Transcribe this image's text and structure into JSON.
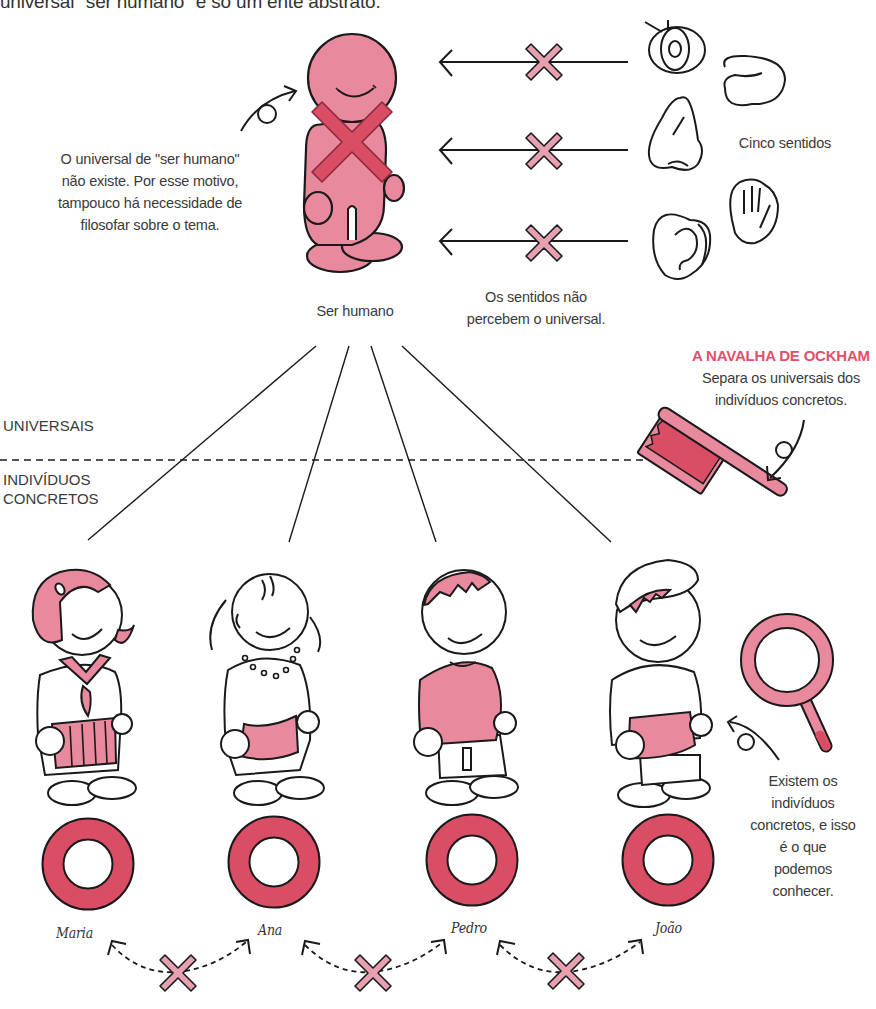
{
  "header": {
    "cut_off_line": "universal \"ser humano\" é só um ente abstrato."
  },
  "universal_section": {
    "figure_label": "Ser humano",
    "note_left": [
      "O universal de \"ser humano\"",
      "não existe. Por esse motivo,",
      "tampouco há necessidade de",
      "filosofar sobre o tema."
    ],
    "senses_label": "Cinco sentidos",
    "senses": [
      "eye",
      "tongue",
      "nose",
      "hand",
      "ear"
    ],
    "senses_caption": [
      "Os sentidos não",
      "percebem o universal."
    ]
  },
  "razor": {
    "title": "A NAVALHA DE OCKHAM",
    "caption": [
      "Separa os universais dos",
      "indivíduos concretos."
    ]
  },
  "divider": {
    "upper_label": "UNIVERSAIS",
    "lower_label": [
      "INDIVÍDUOS",
      "CONCRETOS"
    ]
  },
  "individuals": [
    {
      "name": "Maria"
    },
    {
      "name": "Ana"
    },
    {
      "name": "Pedro"
    },
    {
      "name": "João"
    }
  ],
  "magnifier_caption": [
    "Existem os",
    "indivíduos",
    "concretos, e isso",
    "é o que podemos",
    "conhecer."
  ],
  "colors": {
    "pink_light": "#e8899d",
    "pink_accent": "#e0506c",
    "stroke": "#1a1a1a",
    "text": "#3a3a3a"
  }
}
